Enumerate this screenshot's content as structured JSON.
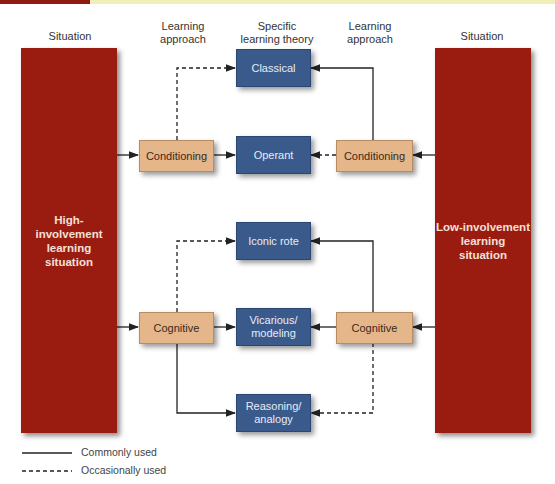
{
  "column_headers": {
    "left_situation": "Situation",
    "left_approach_line1": "Learning",
    "left_approach_line2": "approach",
    "theory_line1": "Specific",
    "theory_line2": "learning theory",
    "right_approach_line1": "Learning",
    "right_approach_line2": "approach",
    "right_situation": "Situation"
  },
  "situations": {
    "high": {
      "line1": "High-involvement",
      "line2": "learning",
      "line3": "situation"
    },
    "low": {
      "line1": "Low-involvement",
      "line2": "learning",
      "line3": "situation"
    }
  },
  "approaches": {
    "left_conditioning": "Conditioning",
    "right_conditioning": "Conditioning",
    "left_cognitive": "Cognitive",
    "right_cognitive": "Cognitive"
  },
  "theories": {
    "classical": "Classical",
    "operant": "Operant",
    "iconic_rote": "Iconic rote",
    "vicarious_line1": "Vicarious/",
    "vicarious_line2": "modeling",
    "reasoning_line1": "Reasoning/",
    "reasoning_line2": "analogy"
  },
  "legend": {
    "solid": "Commonly used",
    "dashed": "Occasionally used"
  },
  "colors": {
    "situation_red": "#9a1c11",
    "theory_blue": "#3a5a8c",
    "approach_tan": "#e4b68a",
    "header_yellow": "#f1efb8"
  }
}
